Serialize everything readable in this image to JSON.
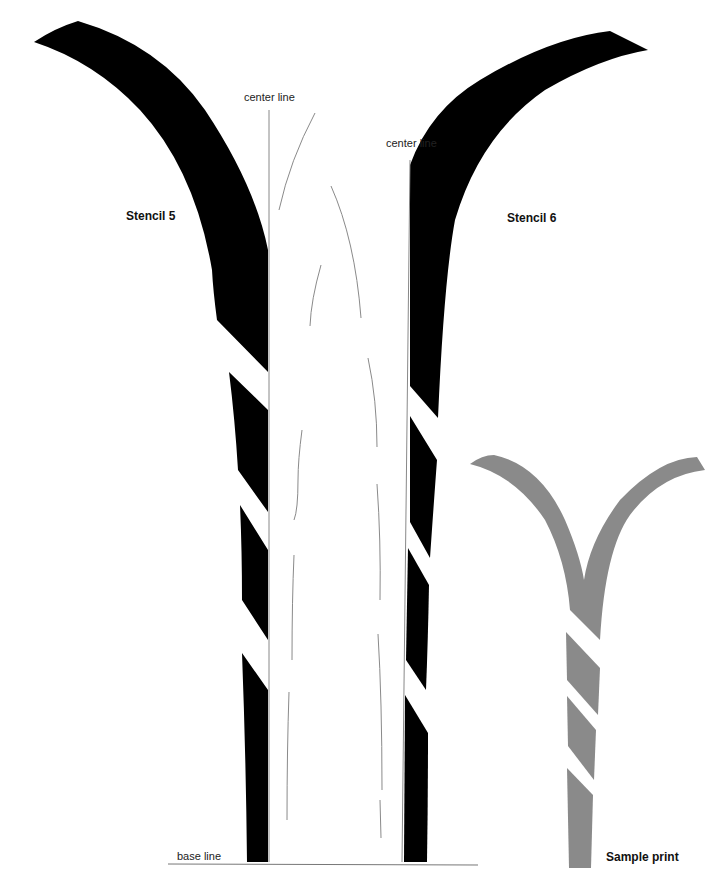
{
  "labels": {
    "center_line_left": "center line",
    "center_line_right": "center line",
    "stencil_5": "Stencil 5",
    "stencil_6": "Stencil 6",
    "base_line": "base line",
    "sample_print": "Sample print"
  },
  "colors": {
    "stencil_fill": "#000000",
    "sample_fill": "#8a8a8a",
    "guide_line": "#888888",
    "background": "#ffffff"
  }
}
